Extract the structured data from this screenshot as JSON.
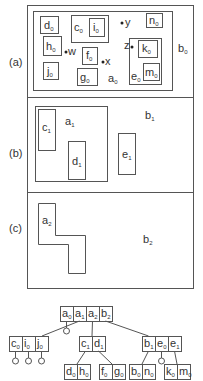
{
  "figure": {
    "panels": [
      {
        "label": "(a)",
        "outer_region": {
          "name": "b",
          "sub": "0"
        },
        "inner_region": {
          "name": "a",
          "sub": "0"
        },
        "rects": [
          {
            "name": "d",
            "sub": "0"
          },
          {
            "name": "c",
            "sub": "0"
          },
          {
            "name": "i",
            "sub": "0"
          },
          {
            "name": "h",
            "sub": "0"
          },
          {
            "name": "f",
            "sub": "0"
          },
          {
            "name": "j",
            "sub": "0"
          },
          {
            "name": "g",
            "sub": "0"
          },
          {
            "name": "n",
            "sub": "0"
          },
          {
            "name": "e",
            "sub": "0"
          },
          {
            "name": "k",
            "sub": "0"
          },
          {
            "name": "m",
            "sub": "0"
          }
        ],
        "points": [
          {
            "name": "w"
          },
          {
            "name": "x"
          },
          {
            "name": "y"
          },
          {
            "name": "z"
          }
        ]
      },
      {
        "label": "(b)",
        "outer_region": {
          "name": "b",
          "sub": "1"
        },
        "inner_region": {
          "name": "a",
          "sub": "1"
        },
        "rects": [
          {
            "name": "c",
            "sub": "1"
          },
          {
            "name": "d",
            "sub": "1"
          },
          {
            "name": "e",
            "sub": "1"
          }
        ]
      },
      {
        "label": "(c)",
        "outer_region": {
          "name": "b",
          "sub": "2"
        },
        "inner_region": {
          "name": "a",
          "sub": "2"
        }
      }
    ],
    "tree": {
      "root": [
        {
          "name": "a",
          "sub": "0"
        },
        {
          "name": "a",
          "sub": "1"
        },
        {
          "name": "a",
          "sub": "2"
        },
        {
          "name": "b",
          "sub": "2"
        }
      ],
      "level1": [
        {
          "cells": [
            {
              "name": "c",
              "sub": "0"
            },
            {
              "name": "i",
              "sub": "0"
            },
            {
              "name": "j",
              "sub": "0"
            }
          ]
        },
        {
          "cells": [
            {
              "name": "c",
              "sub": "1"
            },
            {
              "name": "d",
              "sub": "1"
            }
          ]
        },
        {
          "cells": [
            {
              "name": "b",
              "sub": "1"
            },
            {
              "name": "e",
              "sub": "0"
            },
            {
              "name": "e",
              "sub": "1"
            }
          ]
        }
      ],
      "level2": [
        {
          "cells": [
            {
              "name": "d",
              "sub": "0"
            },
            {
              "name": "h",
              "sub": "0"
            }
          ]
        },
        {
          "cells": [
            {
              "name": "f",
              "sub": "0"
            },
            {
              "name": "g",
              "sub": "0"
            }
          ]
        },
        {
          "cells": [
            {
              "name": "b",
              "sub": "0"
            },
            {
              "name": "n",
              "sub": "0"
            }
          ]
        },
        {
          "cells": [
            {
              "name": "k",
              "sub": "0"
            },
            {
              "name": "m",
              "sub": "0"
            }
          ]
        }
      ]
    }
  }
}
